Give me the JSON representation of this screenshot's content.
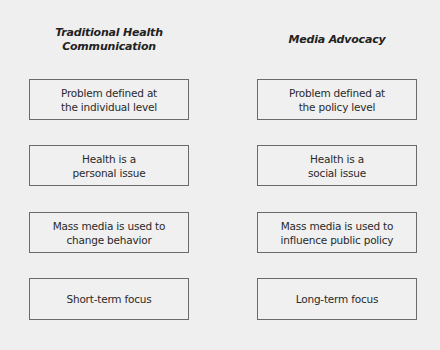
{
  "columns": [
    {
      "heading": "Traditional Health\nCommunication",
      "items": [
        "Problem defined at\nthe individual level",
        "Health is a\npersonal issue",
        "Mass media is used to\nchange behavior",
        "Short-term focus"
      ]
    },
    {
      "heading": "Media Advocacy",
      "items": [
        "Problem defined at\nthe policy level",
        "Health is a\nsocial issue",
        "Mass media is used to\ninfluence public policy",
        "Long-term focus"
      ]
    }
  ]
}
